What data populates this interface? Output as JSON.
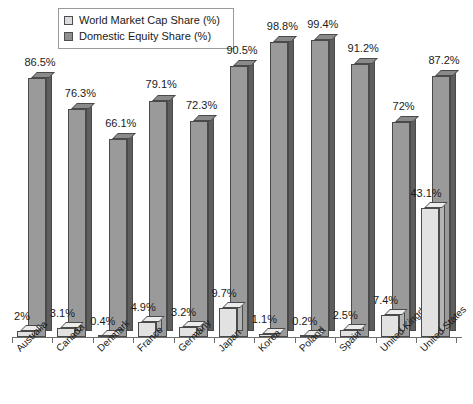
{
  "chart_data": {
    "type": "bar",
    "title": "",
    "subtitle": "",
    "xlabel": "",
    "ylabel": "",
    "ylim": [
      0,
      100
    ],
    "grid": false,
    "legend_position": "top-center",
    "style": "3d-clustered-column",
    "categories": [
      "Australia",
      "Canada",
      "Denmark",
      "France",
      "Germany",
      "Japan",
      "Korea",
      "Poland",
      "Spain",
      "United Kingdom",
      "United States"
    ],
    "series": [
      {
        "name": "World Market Cap Share (%)",
        "color": "#e2e2e2",
        "values": [
          2,
          3.1,
          0.4,
          4.9,
          3.2,
          9.7,
          1.1,
          0.2,
          2.5,
          7.4,
          43.1
        ],
        "labels": [
          "2%",
          "3.1%",
          "0.4%",
          "4.9%",
          "3.2%",
          "9.7%",
          "1.1%",
          "0.2%",
          "2.5%",
          "7.4%",
          "43.1%"
        ]
      },
      {
        "name": "Domestic Equity Share (%)",
        "color": "#9a9a9a",
        "values": [
          86.5,
          76.3,
          66.1,
          79.1,
          72.3,
          90.5,
          98.8,
          99.4,
          91.2,
          72,
          87.2
        ],
        "labels": [
          "86.5%",
          "76.3%",
          "66.1%",
          "79.1%",
          "72.3%",
          "90.5%",
          "98.8%",
          "99.4%",
          "91.2%",
          "72%",
          "87.2%"
        ]
      }
    ]
  },
  "legend": {
    "items": [
      {
        "label": "World Market Cap Share (%)",
        "swatch": "light"
      },
      {
        "label": "Domestic Equity Share (%)",
        "swatch": "dark"
      }
    ]
  }
}
